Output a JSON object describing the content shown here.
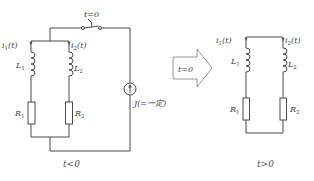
{
  "diagram": {
    "colors": {
      "wire": "#4a4a4a",
      "arrow_outline": "#8a8a8a",
      "text": "#444444"
    },
    "before": {
      "caption": "t<0",
      "switch_label": "t=0",
      "source_label": "J(=一定)",
      "branches": [
        {
          "current": "i",
          "current_sub": "1",
          "current_arg": "(t)",
          "inductor": "L",
          "inductor_sub": "1",
          "resistor": "R",
          "resistor_sub": "1"
        },
        {
          "current": "i",
          "current_sub": "2",
          "current_arg": "(t)",
          "inductor": "L",
          "inductor_sub": "2",
          "resistor": "R",
          "resistor_sub": "2"
        }
      ]
    },
    "transition": {
      "label": "t=0"
    },
    "after": {
      "caption": "t>0",
      "branches": [
        {
          "current": "i",
          "current_sub": "1",
          "current_arg": "(t)",
          "inductor": "L",
          "inductor_sub": "1",
          "resistor": "R",
          "resistor_sub": "1"
        },
        {
          "current": "i",
          "current_sub": "2",
          "current_arg": "(t)",
          "inductor": "L",
          "inductor_sub": "2",
          "resistor": "R",
          "resistor_sub": "2"
        }
      ]
    }
  }
}
